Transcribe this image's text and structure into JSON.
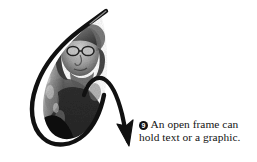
{
  "figure": {
    "background_color": "#ffffff",
    "ink_color": "#111111",
    "width": 257,
    "height": 162
  },
  "annotation": {
    "bullet_label": "9",
    "bullet_style": "filled-circle-white-numeral",
    "line_1": "An open frame can",
    "line_2": "hold text or a graphic.",
    "full_text": "An open frame can hold text or a graphic.",
    "text_color": "#131313"
  },
  "drawing": {
    "frame_shape": "open hand-drawn lasso loop",
    "stroke_color": "#111111",
    "arrow_label": "callout-arrow",
    "arrow_direction": "down-right",
    "arrow_tip": {
      "x": 128,
      "y": 143
    }
  },
  "photo": {
    "alt_label": "grayscale portrait photograph clipped inside open frame",
    "tone": "grayscale"
  }
}
